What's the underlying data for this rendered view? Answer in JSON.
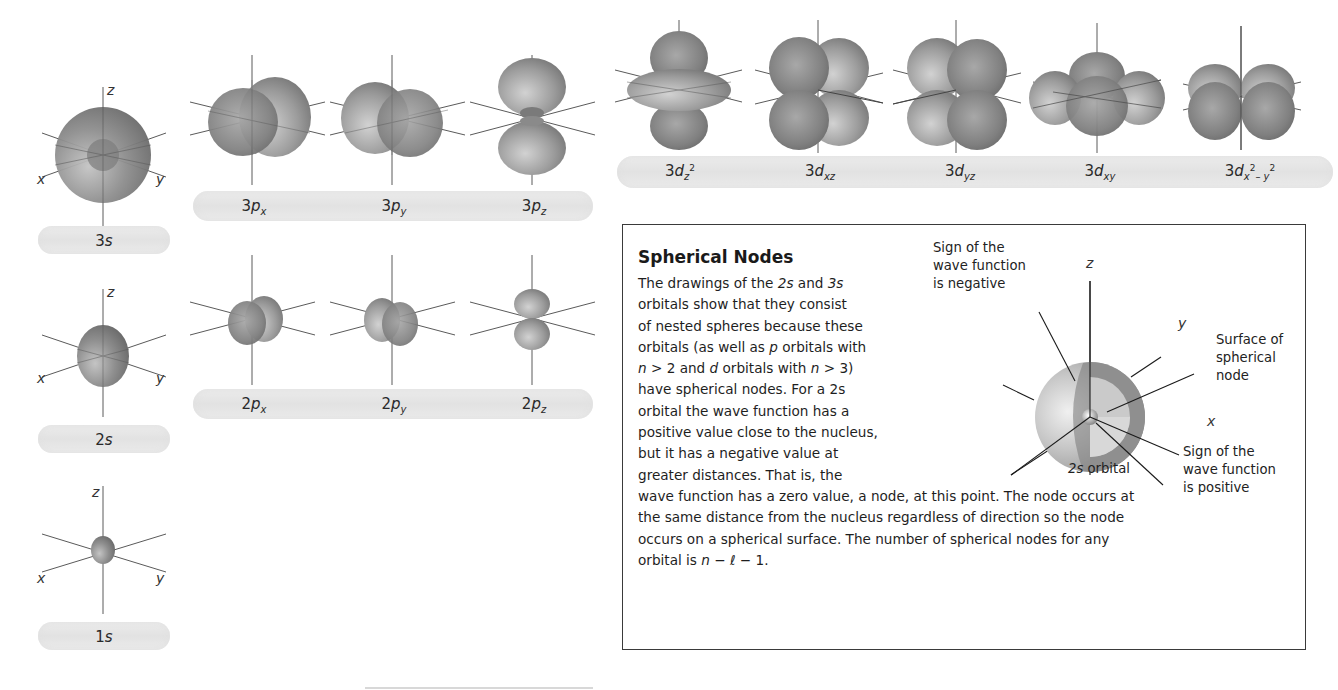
{
  "s_orbitals": [
    {
      "id": "3s",
      "n": "3",
      "l": "s",
      "axes": {
        "x": "x",
        "y": "y",
        "z": "z"
      }
    },
    {
      "id": "2s",
      "n": "2",
      "l": "s",
      "axes": {
        "x": "x",
        "y": "y",
        "z": "z"
      }
    },
    {
      "id": "1s",
      "n": "1",
      "l": "s",
      "axes": {
        "x": "x",
        "y": "y",
        "z": "z"
      }
    }
  ],
  "p3_orbitals": [
    {
      "id": "3px",
      "n": "3",
      "l": "p",
      "sub": "x"
    },
    {
      "id": "3py",
      "n": "3",
      "l": "p",
      "sub": "y"
    },
    {
      "id": "3pz",
      "n": "3",
      "l": "p",
      "sub": "z"
    }
  ],
  "p2_orbitals": [
    {
      "id": "2px",
      "n": "2",
      "l": "p",
      "sub": "x"
    },
    {
      "id": "2py",
      "n": "2",
      "l": "p",
      "sub": "y"
    },
    {
      "id": "2pz",
      "n": "2",
      "l": "p",
      "sub": "z"
    }
  ],
  "d_orbitals": [
    {
      "id": "3dz2",
      "n": "3",
      "l": "d",
      "sub": "z",
      "sup": "2",
      "sub2": "",
      "sup2": ""
    },
    {
      "id": "3dxz",
      "n": "3",
      "l": "d",
      "sub": "xz",
      "sup": "",
      "sub2": "",
      "sup2": ""
    },
    {
      "id": "3dyz",
      "n": "3",
      "l": "d",
      "sub": "yz",
      "sup": "",
      "sub2": "",
      "sup2": ""
    },
    {
      "id": "3dxy",
      "n": "3",
      "l": "d",
      "sub": "xy",
      "sup": "",
      "sub2": "",
      "sup2": ""
    },
    {
      "id": "3dx2-y2",
      "n": "3",
      "l": "d",
      "sub": "x",
      "sup": "2",
      "sub2": "– y",
      "sup2": "2"
    }
  ],
  "box": {
    "title": "Spherical Nodes",
    "lines": [
      [
        "The drawings of the ",
        {
          "i": "2s"
        },
        " and ",
        {
          "i": "3s"
        }
      ],
      [
        "orbitals show that they consist"
      ],
      [
        "of nested spheres because these"
      ],
      [
        "orbitals (as well as ",
        {
          "i": "p"
        },
        " orbitals with"
      ],
      [
        {
          "i": "n"
        },
        " > 2 and ",
        {
          "i": "d"
        },
        " orbitals with ",
        {
          "i": "n"
        },
        " > 3)"
      ],
      [
        "have spherical nodes. For a 2s"
      ],
      [
        "orbital the wave function has a"
      ],
      [
        "positive value close to the nucleus,"
      ],
      [
        "but it has a negative value at"
      ],
      [
        "greater distances. That is, the"
      ],
      [
        "wave function has a zero value, a node, at this point. The node occurs at"
      ],
      [
        "the same distance from the nucleus regardless of direction so the node"
      ],
      [
        "occurs on a spherical surface. The number of spherical nodes for any"
      ],
      [
        "orbital is ",
        {
          "i": "n"
        },
        " − ",
        {
          "i": "ℓ"
        },
        " − 1."
      ]
    ],
    "diagram": {
      "caption_n": "2",
      "caption_l": "s",
      "caption_rest": " orbital",
      "axes": {
        "x": "x",
        "y": "y",
        "z": "z"
      },
      "annotations": {
        "negative": "Sign of the\nwave function\nis negative",
        "surface": "Surface of\nspherical\nnode",
        "positive": "Sign of the\nwave function\nis positive"
      }
    }
  },
  "colors": {
    "orbital_dark": "#6e6e6e",
    "orbital_mid": "#9a9a9a",
    "orbital_light": "#cfcfcf",
    "band": "#e6e6e6",
    "axis_line": "#555555",
    "border": "#3a3a3a"
  }
}
